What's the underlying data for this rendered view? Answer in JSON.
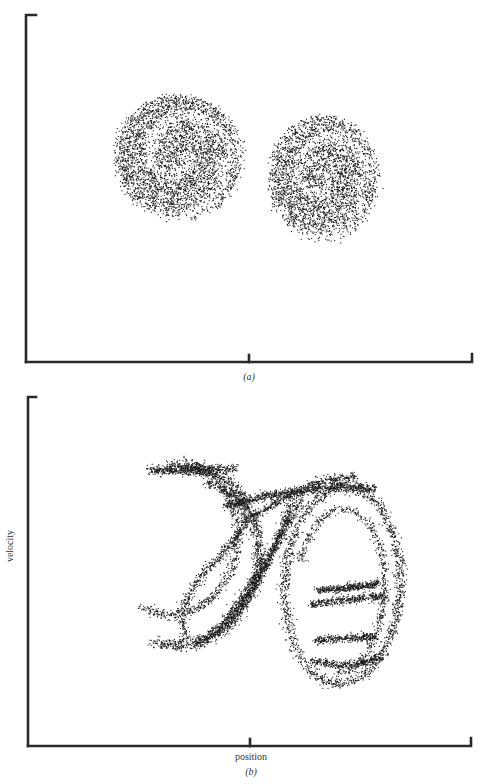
{
  "figure": {
    "panels": [
      {
        "id": "a",
        "caption": "(a)",
        "xlabel": "",
        "ylabel": ""
      },
      {
        "id": "b",
        "caption": "(b)",
        "xlabel": "position",
        "ylabel": "velocity"
      }
    ]
  },
  "chart_data": [
    {
      "type": "scatter",
      "panel": "(a)",
      "title": "",
      "xlabel": "",
      "ylabel": "",
      "x_ticks": [
        "center"
      ],
      "grid": false,
      "legend": "none",
      "description": "Diffuse two-lobed point cloud (strange attractor Poincare section, noisy); left lobe larger, right lobe lower-right, lobes joined near center",
      "xlim": [
        -1,
        1
      ],
      "ylim": [
        -1,
        1
      ],
      "lobes": [
        {
          "name": "left-lobe",
          "center": [
            -0.32,
            0.18
          ],
          "radius": [
            0.28,
            0.36
          ],
          "points": 4200
        },
        {
          "name": "right-lobe",
          "center": [
            0.33,
            0.06
          ],
          "radius": [
            0.24,
            0.36
          ],
          "points": 3600
        }
      ],
      "point_color": "#1a1a1a"
    },
    {
      "type": "scatter",
      "panel": "(b)",
      "title": "",
      "xlabel": "position",
      "ylabel": "velocity",
      "x_ticks": [
        "center"
      ],
      "grid": false,
      "legend": "none",
      "description": "Fractal-folded filaments of a strange attractor in position-velocity phase space; left S-shaped fold and right oval fold with interior horizontal striations",
      "xlim": [
        -1,
        1
      ],
      "ylim": [
        -1,
        1
      ],
      "filaments": [
        {
          "name": "left-outer-arc",
          "points": 1400
        },
        {
          "name": "left-inner-folds",
          "points": 1500
        },
        {
          "name": "bridge-strands",
          "points": 1200
        },
        {
          "name": "right-outer-oval",
          "points": 1500
        },
        {
          "name": "right-inner-stripes",
          "points": 1100
        }
      ],
      "point_color": "#1a1a1a"
    }
  ]
}
